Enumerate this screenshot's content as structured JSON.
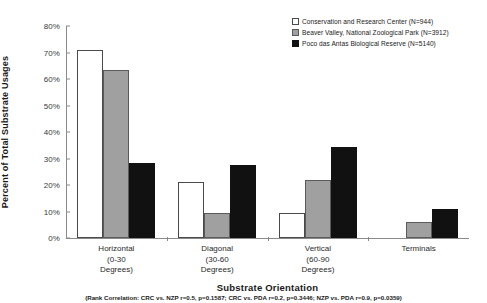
{
  "chart_data": {
    "type": "bar",
    "title": "",
    "xlabel": "Substrate Orientation",
    "ylabel": "Percent of Total Substrate Usages",
    "ylim": [
      0,
      80
    ],
    "ytick_labels": [
      "80%",
      "70%",
      "60%",
      "50%",
      "40%",
      "30%",
      "20%",
      "10%",
      "0%"
    ],
    "ytick_values": [
      80,
      70,
      60,
      50,
      40,
      30,
      20,
      10,
      0
    ],
    "grid": false,
    "legend_position": "top-right",
    "categories": [
      "Horizontal (0-30 Degrees)",
      "Diagonal (30-60 Degrees)",
      "Vertical (60-90 Degrees)",
      "Terminals"
    ],
    "category_lines": [
      [
        "Horizontal",
        "(0-30",
        "Degrees)"
      ],
      [
        "Diagonal",
        "(30-60",
        "Degrees)"
      ],
      [
        "Vertical",
        "(60-90",
        "Degrees)"
      ],
      [
        "Terminals",
        "",
        ""
      ]
    ],
    "series": [
      {
        "name": "Conservation and Research Center (N=944)",
        "short": "CRC",
        "color": "#ffffff",
        "values": [
          71.0,
          21.0,
          9.4,
          0.0
        ]
      },
      {
        "name": "Beaver Valley, National Zoological Park (N=3912)",
        "short": "NZP",
        "color": "#a0a0a0",
        "values": [
          63.5,
          9.3,
          21.8,
          5.9
        ]
      },
      {
        "name": "Poco das Antas Biological Reserve (N=5140)",
        "short": "PDA",
        "color": "#111111",
        "values": [
          28.2,
          27.6,
          34.2,
          11.0
        ]
      }
    ],
    "annotation": "(Rank Correlation: CRC vs. NZP r=0.5, p=0.1587; CRC vs. PDA r=0.2, p=0.3446; NZP vs. PDA r=0.9, p=0.0359)"
  }
}
